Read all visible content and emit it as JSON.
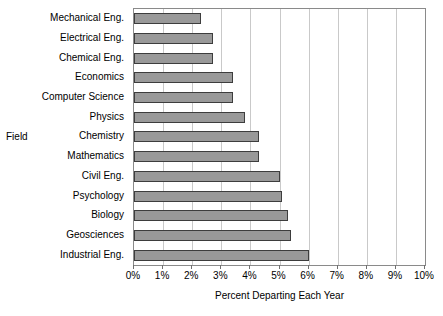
{
  "chart_data": {
    "type": "bar",
    "orientation": "horizontal",
    "title": "",
    "xlabel": "Percent Departing Each Year",
    "ylabel": "Field",
    "categories": [
      "Mechanical Eng.",
      "Electrical Eng.",
      "Chemical Eng.",
      "Economics",
      "Computer Science",
      "Physics",
      "Chemistry",
      "Mathematics",
      "Civil Eng.",
      "Psychology",
      "Biology",
      "Geosciences",
      "Industrial Eng."
    ],
    "values": [
      2.3,
      2.7,
      2.7,
      3.4,
      3.4,
      3.8,
      4.3,
      4.3,
      5.0,
      5.1,
      5.3,
      5.4,
      6.0
    ],
    "xlim": [
      0,
      10
    ],
    "xtick_labels": [
      "0%",
      "1%",
      "2%",
      "3%",
      "4%",
      "5%",
      "6%",
      "7%",
      "8%",
      "9%",
      "10%"
    ],
    "xtick_values": [
      0,
      1,
      2,
      3,
      4,
      5,
      6,
      7,
      8,
      9,
      10
    ],
    "grid": true,
    "legend": false,
    "bar_color": "#999999",
    "bar_border_color": "#3d3d3d",
    "grid_color": "#c9c9c9",
    "frame_color": "#8a8a8a"
  }
}
